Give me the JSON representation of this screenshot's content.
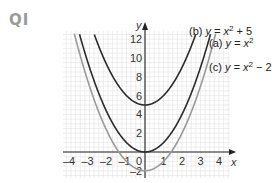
{
  "question": {
    "label": "QI"
  },
  "chart_data": {
    "type": "line",
    "title": "",
    "xlabel": "x",
    "ylabel": "y",
    "xlim": [
      -4.3,
      4.6
    ],
    "ylim": [
      -2.8,
      12.8
    ],
    "grid": true,
    "x_ticks": [
      -4,
      -3,
      -2,
      -1,
      0,
      1,
      2,
      3,
      4
    ],
    "y_ticks": [
      -2,
      2,
      4,
      6,
      8,
      10,
      12
    ],
    "series": [
      {
        "name": "(b) y = x² + 5",
        "id": "b",
        "a": 1,
        "c": 5,
        "color": "#2b2b2b",
        "label_prefix": "(b) ",
        "label_eq": "y = x",
        "label_suffix": " + 5"
      },
      {
        "name": "(a) y = x²",
        "id": "a",
        "a": 1,
        "c": 0,
        "color": "#2b2b2b",
        "label_prefix": "(a) ",
        "label_eq": "y = x",
        "label_suffix": ""
      },
      {
        "name": "(c) y = x² − 2",
        "id": "c",
        "a": 1,
        "c": -2,
        "color": "#9a9a9a",
        "label_prefix": "(c) ",
        "label_eq": "y = x",
        "label_suffix": " − 2"
      }
    ]
  },
  "layout": {
    "origin_x": 145,
    "origin_y": 152,
    "x_unit": 18.5,
    "y_unit": 9.4,
    "grid_left": 63,
    "grid_right": 230,
    "grid_top": 31,
    "grid_bottom": 178
  }
}
